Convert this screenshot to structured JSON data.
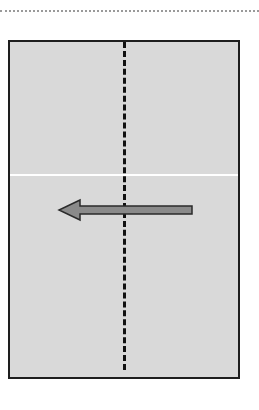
{
  "diagram": {
    "type": "paper-folding-instruction",
    "top_guide": {
      "style": "dotted",
      "color": "#9a9a9a"
    },
    "paper": {
      "shape": "rectangle",
      "fill": "#d9d9d9",
      "border_color": "#1e1e1e"
    },
    "crease": {
      "orientation": "horizontal",
      "color": "#ffffff"
    },
    "fold_line": {
      "orientation": "vertical",
      "style": "dashed",
      "color": "#111111"
    },
    "arrow": {
      "direction": "left",
      "icon": "arrow-left-icon",
      "fill": "#8a8a8a",
      "outline": "#2a2a2a"
    }
  }
}
